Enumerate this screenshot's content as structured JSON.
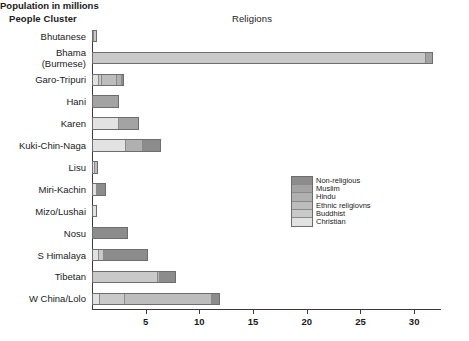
{
  "headers": {
    "people_cluster": "People Cluster",
    "religions": "Religions",
    "xaxis_title": "Population in millions"
  },
  "legend": {
    "position": "inside-right-middle",
    "entries": [
      {
        "label": "Non-religious",
        "color": "#8c8c8c"
      },
      {
        "label": "Muslim",
        "color": "#a3a3a3"
      },
      {
        "label": "Hindu",
        "color": "#b0b0b0"
      },
      {
        "label": "Ethnic religiovns",
        "color": "#bdbdbd"
      },
      {
        "label": "Buddhist",
        "color": "#c9c9c9"
      },
      {
        "label": "Christian",
        "color": "#e2e2e2"
      }
    ]
  },
  "chart_data": {
    "type": "bar",
    "orientation": "horizontal",
    "stacked": true,
    "title": "Religions",
    "xlabel": "Population in millions",
    "ylabel": "People Cluster",
    "xlim": [
      0,
      32.5
    ],
    "xticks": [
      5,
      10,
      15,
      20,
      25,
      30
    ],
    "xtick_labels": [
      "5",
      "10",
      "15",
      "20",
      "25",
      "30"
    ],
    "grid": false,
    "categories": [
      "Bhutanese",
      "Bhama (Burmese)",
      "Garo-Tripuri",
      "Hani",
      "Karen",
      "Kuki-Chin-Naga",
      "Lisu",
      "Miri-Kachin",
      "Mizo/Lushai",
      "Nosu",
      "S Himalaya",
      "Tibetan",
      "W China/Lolo"
    ],
    "series": [
      {
        "name": "Christian",
        "color": "#e2e2e2",
        "values": [
          0.1,
          0.0,
          0.55,
          0.0,
          2.5,
          3.2,
          0.35,
          0.45,
          0.45,
          0.0,
          0.55,
          0.0,
          0.7
        ]
      },
      {
        "name": "Buddhist",
        "color": "#c9c9c9",
        "values": [
          0.35,
          31.2,
          0.3,
          0.0,
          0.0,
          0.0,
          0.0,
          0.0,
          0.0,
          0.0,
          0.55,
          6.2,
          2.3
        ]
      },
      {
        "name": "Ethnic religiovns",
        "color": "#bdbdbd",
        "values": [
          0.0,
          0.0,
          1.5,
          0.0,
          0.0,
          0.0,
          0.2,
          0.0,
          0.0,
          0.0,
          0.0,
          0.0,
          8.3
        ]
      },
      {
        "name": "Hindu",
        "color": "#b0b0b0",
        "values": [
          0.0,
          0.0,
          0.55,
          0.0,
          0.0,
          1.6,
          0.0,
          0.0,
          0.0,
          0.0,
          0.0,
          0.15,
          0.0
        ]
      },
      {
        "name": "Muslim",
        "color": "#a3a3a3",
        "values": [
          0.0,
          0.55,
          0.0,
          2.55,
          1.9,
          0.0,
          0.0,
          0.0,
          0.0,
          0.0,
          0.0,
          0.0,
          0.0
        ]
      },
      {
        "name": "Non-religious",
        "color": "#8c8c8c",
        "values": [
          0.0,
          0.0,
          0.12,
          0.0,
          0.0,
          1.6,
          0.0,
          0.85,
          0.0,
          3.35,
          4.1,
          1.45,
          0.6
        ]
      }
    ],
    "totals": [
      0.45,
      31.75,
      3.02,
      2.55,
      4.4,
      6.4,
      0.55,
      1.3,
      0.45,
      3.35,
      5.2,
      7.8,
      11.9
    ]
  },
  "style": {
    "bar_border": "#6d6d6d",
    "axis_color": "#3a3a3a",
    "background": "#ffffff"
  }
}
